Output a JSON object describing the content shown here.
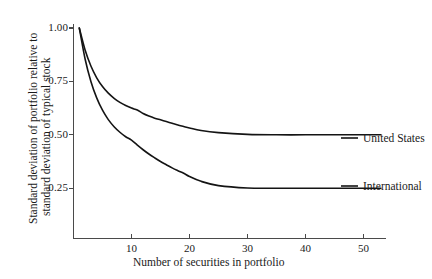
{
  "chart_data": {
    "type": "line",
    "title": "",
    "subtitle": "",
    "xlabel": "Number of securities in portfolio",
    "ylabel": "Standard deviation of portfolio relative to standard deviation of typical stock",
    "ylabel_line1": "Standard deviation of portfolio relative to",
    "ylabel_line2": "standard deviation of typical stock",
    "xlim": [
      0,
      53
    ],
    "ylim": [
      0,
      1.05
    ],
    "grid": false,
    "legend_position": "right-inline",
    "xticks": [
      10,
      20,
      30,
      40,
      50
    ],
    "xtick_labels": [
      "10",
      "20",
      "30",
      "40",
      "50"
    ],
    "yticks": [
      0.25,
      0.5,
      0.75,
      1.0
    ],
    "ytick_labels": [
      "0.25",
      "0.50",
      "0.75",
      "1.00"
    ],
    "series": [
      {
        "name": "United States",
        "color": "#141414",
        "asymptote": 0.5,
        "x": [
          1,
          2,
          3,
          4,
          5,
          6,
          7,
          8,
          9,
          10,
          11,
          12,
          13,
          14,
          15,
          16,
          17,
          18,
          19,
          20,
          22,
          25,
          30,
          35,
          40,
          45,
          50,
          53
        ],
        "values": [
          1.0,
          0.897,
          0.822,
          0.767,
          0.726,
          0.695,
          0.671,
          0.652,
          0.637,
          0.625,
          0.616,
          0.6,
          0.588,
          0.578,
          0.57,
          0.562,
          0.554,
          0.546,
          0.539,
          0.532,
          0.52,
          0.51,
          0.502,
          0.5,
          0.5,
          0.5,
          0.5,
          0.5
        ]
      },
      {
        "name": "International",
        "color": "#141414",
        "asymptote": 0.25,
        "x": [
          1,
          2,
          3,
          4,
          5,
          6,
          7,
          8,
          9,
          10,
          11,
          12,
          13,
          14,
          15,
          16,
          17,
          18,
          19,
          20,
          22,
          25,
          30,
          35,
          40,
          45,
          50,
          53
        ],
        "values": [
          1.0,
          0.855,
          0.75,
          0.673,
          0.615,
          0.571,
          0.538,
          0.512,
          0.491,
          0.475,
          0.452,
          0.43,
          0.41,
          0.392,
          0.375,
          0.36,
          0.345,
          0.332,
          0.32,
          0.305,
          0.282,
          0.262,
          0.251,
          0.25,
          0.25,
          0.25,
          0.25,
          0.25
        ]
      }
    ],
    "legend_entries": [
      {
        "label": "United States",
        "value_at_plateau": 0.5
      },
      {
        "label": "International",
        "value_at_plateau": 0.25
      }
    ]
  }
}
